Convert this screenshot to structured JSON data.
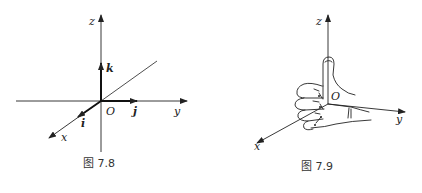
{
  "figures": [
    {
      "caption": "图 7.8",
      "labels": {
        "z": "z",
        "y": "y",
        "x": "x",
        "origin": "O",
        "i": "i",
        "j": "j",
        "k": "k"
      },
      "description": "Right-handed coordinate system with unit vectors i, j, k along x, y, z axes"
    },
    {
      "caption": "图 7.9",
      "labels": {
        "z": "z",
        "y": "y",
        "x": "x",
        "origin": "O"
      },
      "description": "Right-hand rule: thumb along z-axis, fingers curling from x toward y"
    }
  ],
  "colors": {
    "stroke": "#222222",
    "background": "#ffffff"
  }
}
